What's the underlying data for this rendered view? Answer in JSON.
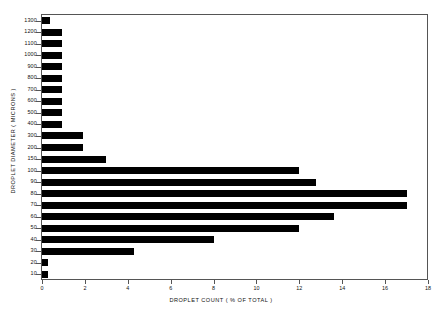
{
  "chart_data": {
    "type": "bar",
    "orientation": "horizontal",
    "title": "",
    "xlabel": "DROPLET COUNT ( % OF TOTAL )",
    "ylabel": "DROPLET DIAMETER ( MICRONS )",
    "xlim": [
      0,
      18
    ],
    "ylim_categories": true,
    "grid": false,
    "legend": null,
    "xticks": [
      0,
      2,
      4,
      6,
      8,
      10,
      12,
      14,
      16,
      18
    ],
    "xtick_labels": [
      "0",
      "2",
      "4",
      "6",
      "8",
      "10",
      "12",
      "14",
      "16",
      "18"
    ],
    "categories": [
      "1300",
      "1200",
      "1100",
      "1000",
      "900",
      "800",
      "700",
      "600",
      "500",
      "400",
      "300",
      "200",
      "150",
      "100",
      "90",
      "80",
      "70",
      "60",
      "50",
      "40",
      "30",
      "20",
      "10"
    ],
    "ytick_labels": [
      "1300",
      "1200",
      "1100",
      "1000",
      "900",
      "800",
      "700",
      "600",
      "500",
      "400",
      "300",
      "200",
      "150",
      "100",
      "90",
      "80",
      "70",
      "60",
      "50",
      "40",
      "30",
      "20",
      "10"
    ],
    "values": [
      0.35,
      0.95,
      0.95,
      0.95,
      0.95,
      0.95,
      0.95,
      0.95,
      0.95,
      0.95,
      1.9,
      1.9,
      3.0,
      12.0,
      12.8,
      17.0,
      17.0,
      13.6,
      12.0,
      8.0,
      4.3,
      0.3,
      0.3
    ],
    "series": [
      {
        "name": "Droplet count",
        "color": "#000000",
        "values": [
          0.35,
          0.95,
          0.95,
          0.95,
          0.95,
          0.95,
          0.95,
          0.95,
          0.95,
          0.95,
          1.9,
          1.9,
          3.0,
          12.0,
          12.8,
          17.0,
          17.0,
          13.6,
          12.0,
          8.0,
          4.3,
          0.3,
          0.3
        ]
      }
    ],
    "colors": {
      "bar": "#000000",
      "axis": "#555555",
      "text": "#111111",
      "background": "#ffffff"
    }
  }
}
